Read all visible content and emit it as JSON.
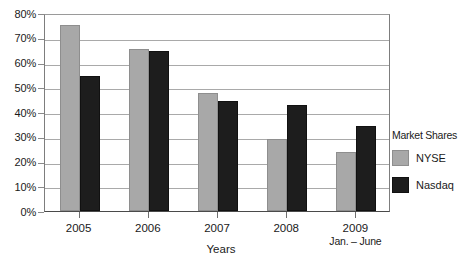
{
  "chart_data": {
    "type": "bar",
    "title": "",
    "xlabel": "Years",
    "ylabel": "",
    "ylim": [
      0,
      80
    ],
    "grid": true,
    "legend_position": "right",
    "legend_title": "Market Shares",
    "categories": [
      "2005",
      "2006",
      "2007",
      "2008",
      "2009"
    ],
    "category_sublabels": [
      "",
      "",
      "",
      "",
      "Jan. – June"
    ],
    "ytick_labels": [
      "80%",
      "70%",
      "60%",
      "50%",
      "40%",
      "30%",
      "20%",
      "10%",
      "0%"
    ],
    "ytick_values": [
      80,
      70,
      60,
      50,
      40,
      30,
      20,
      10,
      0
    ],
    "series": [
      {
        "name": "NYSE",
        "color": "#a8a8a8",
        "values": [
          75,
          65.5,
          47.5,
          29,
          24
        ]
      },
      {
        "name": "Nasdaq",
        "color": "#1d1d1d",
        "values": [
          54.5,
          64.5,
          44.5,
          43,
          34.5
        ]
      }
    ]
  },
  "colors": {
    "nyse": "#a8a8a8",
    "nasdaq": "#1d1d1d",
    "gridline": "#a9a9a9",
    "axis": "#4a4a4a",
    "text": "#1a1a1a",
    "background": "#ffffff"
  }
}
